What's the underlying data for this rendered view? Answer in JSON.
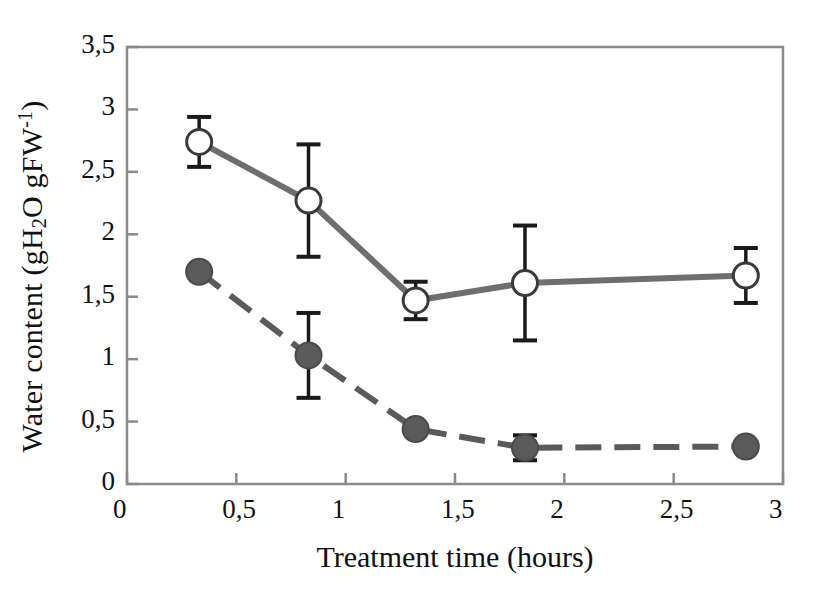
{
  "chart_data": {
    "type": "line",
    "title": "",
    "xlabel": "Treatment time (hours)",
    "ylabel_parts": {
      "prefix": "Water content (gH",
      "sub": "2",
      "mid": "O gFW",
      "sup": "-1",
      "suffix": ")"
    },
    "ylabel": "Water content (gH2O gFW-1)",
    "xlim": [
      0,
      3
    ],
    "ylim": [
      0,
      3.5
    ],
    "grid": false,
    "legend": "none",
    "xticks": [
      "0",
      "0,5",
      "1",
      "1,5",
      "2",
      "2,5",
      "3"
    ],
    "xtick_values": [
      0,
      0.5,
      1,
      1.5,
      2,
      2.5,
      3
    ],
    "yticks": [
      "0",
      "0,5",
      "1",
      "1,5",
      "2",
      "2,5",
      "3",
      "3,5"
    ],
    "ytick_values": [
      0,
      0.5,
      1,
      1.5,
      2,
      2.5,
      3,
      3.5
    ],
    "x": [
      0.33,
      0.83,
      1.32,
      1.82,
      2.83
    ],
    "series": [
      {
        "name": "open-circle-series",
        "marker": "open-circle",
        "line_style": "solid",
        "color": "#6e6e6e",
        "values": [
          2.74,
          2.27,
          1.47,
          1.61,
          1.67
        ],
        "errors": [
          0.2,
          0.45,
          0.15,
          0.46,
          0.22
        ]
      },
      {
        "name": "filled-circle-series",
        "marker": "filled-circle",
        "line_style": "dashed",
        "color": "#5a5a5a",
        "values": [
          1.7,
          1.03,
          0.44,
          0.29,
          0.3
        ],
        "errors": [
          0.04,
          0.34,
          0.02,
          0.1,
          0.0
        ]
      }
    ],
    "colors": {
      "axis": "#8a8a8a",
      "series_open": "#6e6e6e",
      "series_filled": "#5a5a5a",
      "errorbar": "#1a1a1a",
      "text": "#111111",
      "background": "#ffffff"
    }
  }
}
